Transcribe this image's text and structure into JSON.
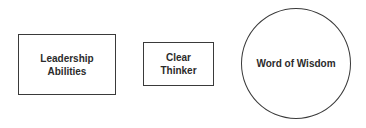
{
  "diagram": {
    "nodes": [
      {
        "id": "leadership",
        "shape": "rectangle",
        "label": "Leadership\nAbilities"
      },
      {
        "id": "clear-thinker",
        "shape": "rectangle",
        "label": "Clear\nThinker"
      },
      {
        "id": "word-of-wisdom",
        "shape": "circle",
        "label": "Word of Wisdom"
      }
    ],
    "colors": {
      "stroke": "#3a3a3a",
      "text": "#2b2b2b",
      "background": "#ffffff"
    }
  }
}
